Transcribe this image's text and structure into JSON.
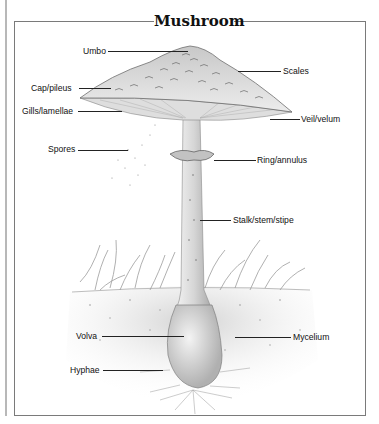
{
  "title": "Mushroom",
  "labels": {
    "umbo": "Umbo",
    "scales": "Scales",
    "cap": "Cap/pileus",
    "gills": "Gills/lamellae",
    "veil": "Veil/velum",
    "spores": "Spores",
    "ring": "Ring/annulus",
    "stalk": "Stalk/stem/stipe",
    "volva": "Volva",
    "mycelium": "Mycelium",
    "hyphae": "Hyphae"
  },
  "colors": {
    "frame": "#7a7a7a",
    "ink": "#111111",
    "cap_fill": "#d9d9d9",
    "soil": "#e6e6e6"
  }
}
